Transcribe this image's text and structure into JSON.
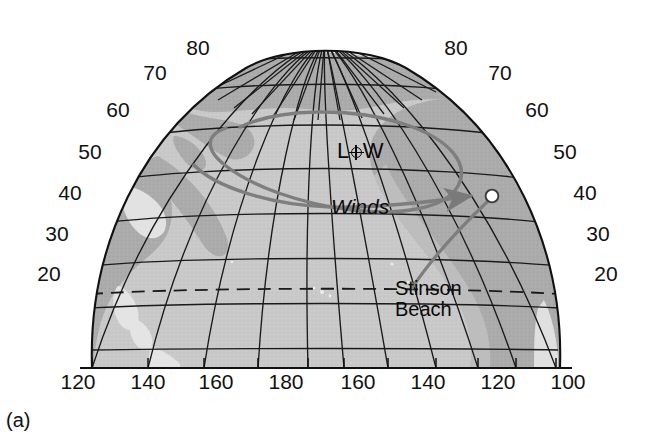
{
  "figure": {
    "panel_caption": "(a)",
    "projection": "polar-stereographic-north-pacific"
  },
  "colors": {
    "background": "#ffffff",
    "ocean": "#c9c9c9",
    "land": "#a9a9a9",
    "globe_outside": "#e8e8e8",
    "graticule": "#1a1a1a",
    "outline": "#111111",
    "trajectory": "#7a7a7a",
    "text": "#111111"
  },
  "axes": {
    "latitude_label_text": "Latitude (degrees N)",
    "longitude_label_text": "Longitude (degrees)",
    "latitude_left": [
      {
        "label": "80",
        "x": 198,
        "y": 47
      },
      {
        "label": "70",
        "x": 155,
        "y": 72
      },
      {
        "label": "60",
        "x": 118,
        "y": 109
      },
      {
        "label": "50",
        "x": 90,
        "y": 151
      },
      {
        "label": "40",
        "x": 70,
        "y": 192
      },
      {
        "label": "30",
        "x": 57,
        "y": 233
      },
      {
        "label": "20",
        "x": 49,
        "y": 273
      }
    ],
    "latitude_right": [
      {
        "label": "80",
        "x": 456,
        "y": 47
      },
      {
        "label": "70",
        "x": 500,
        "y": 72
      },
      {
        "label": "60",
        "x": 537,
        "y": 109
      },
      {
        "label": "50",
        "x": 565,
        "y": 151
      },
      {
        "label": "40",
        "x": 585,
        "y": 192
      },
      {
        "label": "30",
        "x": 598,
        "y": 233
      },
      {
        "label": "20",
        "x": 606,
        "y": 273
      }
    ],
    "longitude_bottom": [
      {
        "label": "120",
        "x": 78,
        "y": 371
      },
      {
        "label": "140",
        "x": 148,
        "y": 371
      },
      {
        "label": "160",
        "x": 216,
        "y": 371
      },
      {
        "label": "180",
        "x": 286,
        "y": 371
      },
      {
        "label": "160",
        "x": 358,
        "y": 371
      },
      {
        "label": "140",
        "x": 428,
        "y": 371
      },
      {
        "label": "120",
        "x": 498,
        "y": 371
      },
      {
        "label": "100",
        "x": 568,
        "y": 371
      }
    ]
  },
  "annotations": {
    "low_prefix": "L",
    "low_suffix": "W",
    "low_symbol_name": "circled-cross-low-pressure-center",
    "winds": "Winds",
    "stinson_line1": "Stinson",
    "stinson_line2": "Beach"
  },
  "features": {
    "tropic_line_label": "dashed-latitude-line-23N",
    "trajectory_marker_label": "open-circle-endpoint-marker",
    "spiral_label": "cyclonic-wind-spiral-with-arrow"
  }
}
